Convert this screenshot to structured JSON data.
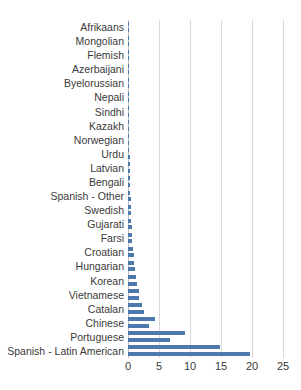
{
  "chart_data": {
    "type": "bar",
    "orientation": "horizontal",
    "title": "",
    "xlabel": "",
    "ylabel": "",
    "xlim": [
      0,
      25
    ],
    "xticks": [
      0,
      5,
      10,
      15,
      20,
      25
    ],
    "xticklabels": [
      "0",
      "5",
      "10",
      "15",
      "20",
      "25"
    ],
    "grid": true,
    "legend": false,
    "bar_color": "#4e79ac",
    "gridline_color": "#d9d9d9",
    "categories": [
      "Afrikaans",
      "Mongolian",
      "Flemish",
      "Azerbaijani",
      "Byelorussian",
      "Nepali",
      "Sindhi",
      "Kazakh",
      "Norwegian",
      "Urdu",
      "Latvian",
      "Bengali",
      "Spanish - Other",
      "Swedish",
      "Gujarati",
      "Farsi",
      "Croatian",
      "Hungarian",
      "Korean",
      "Vietnamese",
      "Catalan",
      "Chinese",
      "Portuguese",
      "Spanish - Latin American"
    ],
    "values": [
      0.05,
      0.05,
      0.05,
      0.05,
      0.08,
      0.1,
      0.1,
      0.15,
      0.2,
      0.25,
      0.3,
      0.35,
      0.45,
      0.5,
      0.6,
      0.7,
      0.9,
      1.1,
      1.5,
      1.8,
      2.6,
      3.4,
      6.7,
      19.6
    ],
    "unlabeled_values": [
      0.05,
      0.05,
      0.05,
      0.05,
      0.06,
      0.08,
      0.1,
      0.12,
      0.18,
      0.22,
      0.28,
      0.32,
      0.4,
      0.5,
      0.55,
      0.65,
      0.8,
      1.0,
      1.3,
      1.7,
      2.3,
      4.3,
      9.2,
      14.8
    ],
    "extra_values": [
      7.4,
      11.2
    ]
  }
}
